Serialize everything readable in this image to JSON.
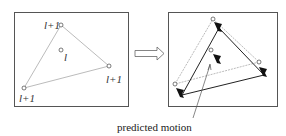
{
  "diagram": {
    "left_panel": {
      "vertex_labels": [
        "l+1",
        "l+1",
        "l+1"
      ],
      "center_label": "l"
    },
    "transition_arrow": "double-right-arrow",
    "right_panel": {
      "caption": "predicted motion"
    },
    "colors": {
      "frame": "#555555",
      "old_edges": "#aaaaaa",
      "new_edges": "#222222",
      "markers": "#111111"
    }
  }
}
